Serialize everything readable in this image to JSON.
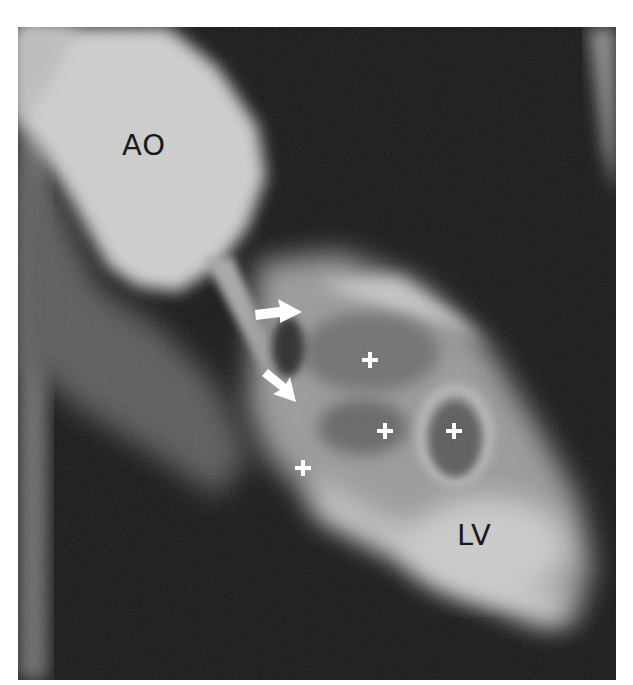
{
  "figure": {
    "type": "angiogram-radiograph",
    "caption_fragment": "",
    "labels": {
      "aorta": "AO",
      "left_ventricle": "LV"
    },
    "markers": {
      "arrows": [
        {
          "name": "upper-arrow",
          "direction": "right"
        },
        {
          "name": "lower-arrow",
          "direction": "down-right"
        }
      ],
      "plus_signs": 4
    },
    "colors": {
      "background": "#111111",
      "contrast_bright": "#d8d8d8",
      "label_text": "#1a1a1a",
      "marker_white": "#ffffff"
    }
  }
}
